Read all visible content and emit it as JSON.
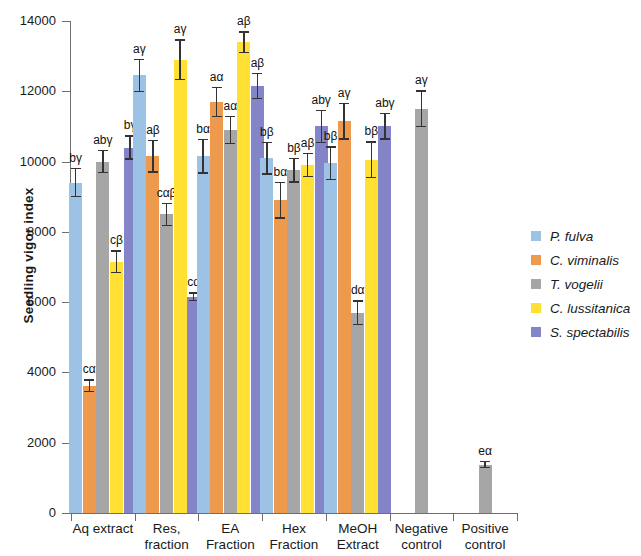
{
  "chart_data": {
    "type": "bar",
    "title": "",
    "xlabel": "",
    "ylabel": "Seedling vigor index",
    "ylim": [
      0,
      14000
    ],
    "yticks": [
      0,
      2000,
      4000,
      6000,
      8000,
      10000,
      12000,
      14000
    ],
    "grid": false,
    "legend_position": "right",
    "categories": [
      "Aq extract",
      "Res, fraction",
      "EA Fraction",
      "Hex Fraction",
      "MeOH Extract",
      "Negative control",
      "Positive control"
    ],
    "category_lines": [
      [
        "Aq extract",
        ""
      ],
      [
        "Res,",
        "fraction"
      ],
      [
        "EA",
        "Fraction"
      ],
      [
        "Hex",
        "Fraction"
      ],
      [
        "MeOH",
        "Extract"
      ],
      [
        "Negative",
        "control"
      ],
      [
        "Positive",
        "control"
      ]
    ],
    "series": [
      {
        "name": "P. fulva",
        "color": "#9CC3E5",
        "values": [
          9400,
          12450,
          10150,
          10100,
          9950,
          null,
          null
        ],
        "errors": [
          420,
          480,
          500,
          470,
          480,
          null,
          null
        ],
        "labels": [
          "bγ",
          "aγ",
          "bα",
          "bβ",
          "bβ",
          "",
          ""
        ]
      },
      {
        "name": "C. viminalis",
        "color": "#ED9A4F",
        "values": [
          3620,
          10150,
          11700,
          8900,
          11150,
          null,
          null
        ],
        "errors": [
          180,
          470,
          430,
          520,
          530,
          null,
          null
        ],
        "labels": [
          "cα",
          "aβ",
          "aα",
          "bα",
          "aγ",
          "",
          ""
        ]
      },
      {
        "name": "T. vogelii",
        "color": "#A6A6A6",
        "values": [
          10000,
          8500,
          10900,
          9750,
          5700,
          11500,
          1380
        ],
        "errors": [
          330,
          330,
          400,
          350,
          350,
          530,
          110
        ],
        "labels": [
          "abγ",
          "cαβ",
          "aα",
          "bβ",
          "dα",
          "aγ",
          "eα"
        ]
      },
      {
        "name": "C. lussitanica",
        "color": "#FFE033",
        "values": [
          7150,
          12900,
          13400,
          9900,
          10050,
          null,
          null
        ],
        "errors": [
          330,
          580,
          310,
          350,
          530,
          null,
          null
        ],
        "labels": [
          "cβ",
          "aγ",
          "aβ",
          "aβ",
          "bβ",
          "",
          ""
        ]
      },
      {
        "name": "S. spectabilis",
        "color": "#8484C8",
        "values": [
          10400,
          6150,
          12150,
          11000,
          11000,
          null,
          null
        ],
        "errors": [
          350,
          130,
          380,
          470,
          380,
          null,
          null
        ],
        "labels": [
          "bγ",
          "cα",
          "aβ",
          "abγ",
          "abγ",
          "",
          ""
        ]
      }
    ],
    "legend": [
      {
        "label": "P. fulva",
        "color": "#9CC3E5"
      },
      {
        "label": "C. viminalis",
        "color": "#ED9A4F"
      },
      {
        "label": "T. vogelii",
        "color": "#A6A6A6"
      },
      {
        "label": "C. lussitanica",
        "color": "#FFE033"
      },
      {
        "label": "S. spectabilis",
        "color": "#8484C8"
      }
    ]
  }
}
